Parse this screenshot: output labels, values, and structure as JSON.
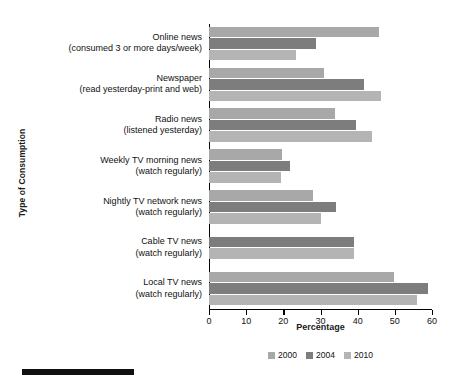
{
  "chart_data": {
    "type": "bar",
    "orientation": "horizontal",
    "title": "",
    "xlabel": "Percentage",
    "ylabel": "Type of Consumption",
    "xlim": [
      0,
      60
    ],
    "xticks": [
      0,
      10,
      20,
      30,
      40,
      50,
      60
    ],
    "grid": false,
    "legend_position": "bottom-center",
    "categories": [
      "Online news (consumed 3 or more days/week)",
      "Newspaper (read yesterday-print and web)",
      "Radio news (listened yesterday)",
      "Weekly TV morning news (watch regularly)",
      "Nightly TV network news (watch regularly)",
      "Cable TV news (watch regularly)",
      "Local TV news (watch regularly)"
    ],
    "category_lines": [
      [
        "Online news",
        "(consumed 3 or more days/week)"
      ],
      [
        "Newspaper",
        "(read yesterday-print and web)"
      ],
      [
        "Radio news",
        "(listened yesterday)"
      ],
      [
        "Weekly TV morning news",
        "(watch regularly)"
      ],
      [
        "Nightly TV network news",
        "(watch regularly)"
      ],
      [
        "Cable TV news",
        "(watch regularly)"
      ],
      [
        "Local TV news",
        "(watch regularly)"
      ]
    ],
    "series": [
      {
        "name": "2000",
        "color": "#a8a8a8",
        "values": [
          45.7,
          31.0,
          34.0,
          19.7,
          28.1,
          null,
          49.7
        ]
      },
      {
        "name": "2004",
        "color": "#7d7d7d",
        "values": [
          28.9,
          41.6,
          39.5,
          21.9,
          34.1,
          38.9,
          58.9
        ]
      },
      {
        "name": "2010",
        "color": "#b4b4b4",
        "values": [
          23.5,
          46.2,
          43.8,
          19.5,
          30.0,
          38.9,
          55.9
        ]
      }
    ]
  },
  "legend": {
    "items": [
      {
        "label": "2000",
        "color": "#a8a8a8"
      },
      {
        "label": "2004",
        "color": "#7d7d7d"
      },
      {
        "label": "2010",
        "color": "#b4b4b4"
      }
    ]
  },
  "axes": {
    "x_title": "Percentage",
    "y_title": "Type of Consumption",
    "x_tick_labels": [
      "0",
      "10",
      "20",
      "30",
      "40",
      "50",
      "60"
    ]
  },
  "colors": {
    "axis": "#000000",
    "text": "#111111",
    "rule": "#111111"
  }
}
